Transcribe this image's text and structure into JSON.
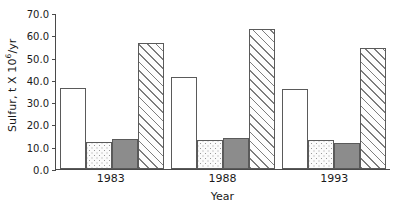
{
  "chart_data": {
    "type": "bar",
    "title": "",
    "xlabel": "Year",
    "ylabel": "Sulfur, t X 10⁶/yr",
    "ylabel_text": "Sulfur, t X 10",
    "ylabel_sup": "6",
    "ylabel_tail": "/yr",
    "categories": [
      "1983",
      "1988",
      "1993"
    ],
    "ylim": [
      0,
      70
    ],
    "ytick_values": [
      0,
      10,
      20,
      30,
      40,
      50,
      60,
      70
    ],
    "ytick_labels": [
      "0.0",
      "10.0",
      "20.0",
      "30.0",
      "40.0",
      "50.0",
      "60.0",
      "70.0"
    ],
    "grid": false,
    "legend": "none",
    "series": [
      {
        "name": "series-open",
        "pattern": "open",
        "values": [
          36.5,
          41.5,
          36.0
        ]
      },
      {
        "name": "series-dotted",
        "pattern": "dotted",
        "values": [
          12.0,
          13.0,
          13.0
        ]
      },
      {
        "name": "series-solid",
        "pattern": "solid",
        "values": [
          13.5,
          14.0,
          11.5
        ]
      },
      {
        "name": "series-hatch",
        "pattern": "hatch",
        "values": [
          56.5,
          63.0,
          54.5
        ]
      }
    ]
  }
}
